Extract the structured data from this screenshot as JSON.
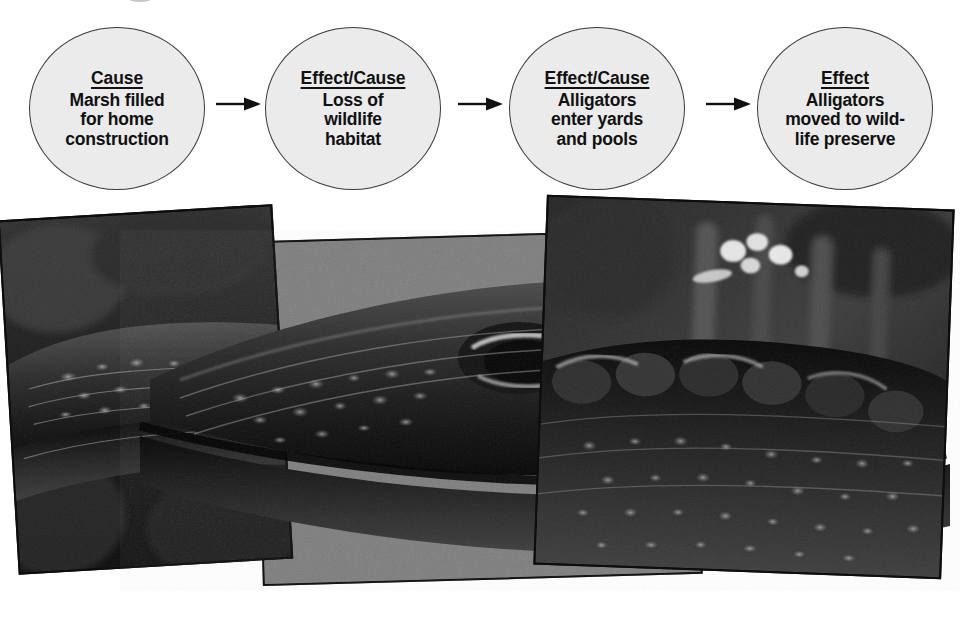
{
  "page": {
    "background_color": "#ffffff",
    "width": 962,
    "height": 623
  },
  "diagram": {
    "type": "cause-effect-flow",
    "node_fill_color": "#ebebeb",
    "node_stroke_color": "#3a3a3a",
    "arrow_color": "#111111",
    "nodes": [
      {
        "id": "node-1",
        "title": "Cause",
        "body": "Marsh filled\nfor home\nconstruction"
      },
      {
        "id": "node-2",
        "title": "Effect/Cause",
        "body": "Loss of\nwildlife\nhabitat"
      },
      {
        "id": "node-3",
        "title": "Effect/Cause",
        "body": "Alligators\nenter yards\nand pools"
      },
      {
        "id": "node-4",
        "title": "Effect",
        "body": "Alligators\nmoved to wild-\nlife preserve"
      }
    ],
    "arrows": [
      {
        "id": "arrow-1",
        "from": "node-1",
        "to": "node-2",
        "glyph": "right-arrow"
      },
      {
        "id": "arrow-2",
        "from": "node-2",
        "to": "node-3",
        "glyph": "right-arrow"
      },
      {
        "id": "arrow-3",
        "from": "node-3",
        "to": "node-4",
        "glyph": "right-arrow"
      }
    ]
  },
  "photo": {
    "subject": "alligator head close-up",
    "style": "black-and-white halftone photo collage",
    "panel_border_color": "#0d0d0d",
    "backdrop_color": "#777777",
    "panels": [
      {
        "id": "panel-left",
        "rotation_deg": -3.4,
        "z": 2
      },
      {
        "id": "panel-mid",
        "rotation_deg": -1.6,
        "z": 1
      },
      {
        "id": "panel-right",
        "rotation_deg": 2.1,
        "z": 3
      }
    ]
  }
}
